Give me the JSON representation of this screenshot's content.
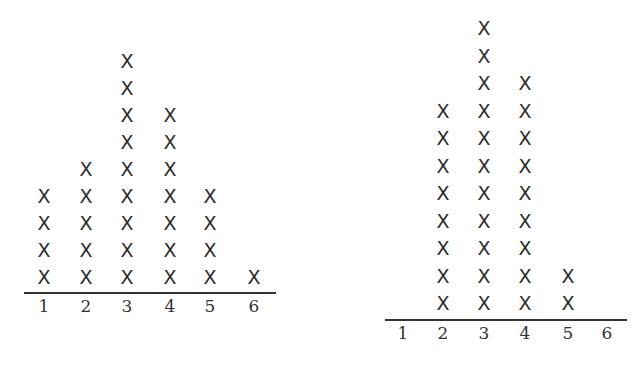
{
  "chart_data": [
    {
      "type": "dot_plot",
      "title": "",
      "xlabel": "",
      "ylabel": "",
      "marker": "X",
      "categories": [
        "1",
        "2",
        "3",
        "4",
        "5",
        "6"
      ],
      "values": [
        4,
        5,
        9,
        7,
        4,
        1
      ],
      "layout": {
        "axis": {
          "x1": 24,
          "x2": 276,
          "y": 292
        },
        "col_x": [
          44,
          86,
          127,
          170,
          210,
          254
        ],
        "base_y": 277,
        "step": 27,
        "label_y": 297
      }
    },
    {
      "type": "dot_plot",
      "title": "",
      "xlabel": "",
      "ylabel": "",
      "marker": "X",
      "categories": [
        "1",
        "2",
        "3",
        "4",
        "5",
        "6"
      ],
      "values": [
        0,
        8,
        11,
        9,
        2,
        0
      ],
      "layout": {
        "axis": {
          "x1": 385,
          "x2": 627,
          "y": 319
        },
        "col_x": [
          403,
          443,
          484,
          525,
          568,
          607
        ],
        "base_y": 303,
        "step": 27.5,
        "label_y": 324
      }
    }
  ]
}
